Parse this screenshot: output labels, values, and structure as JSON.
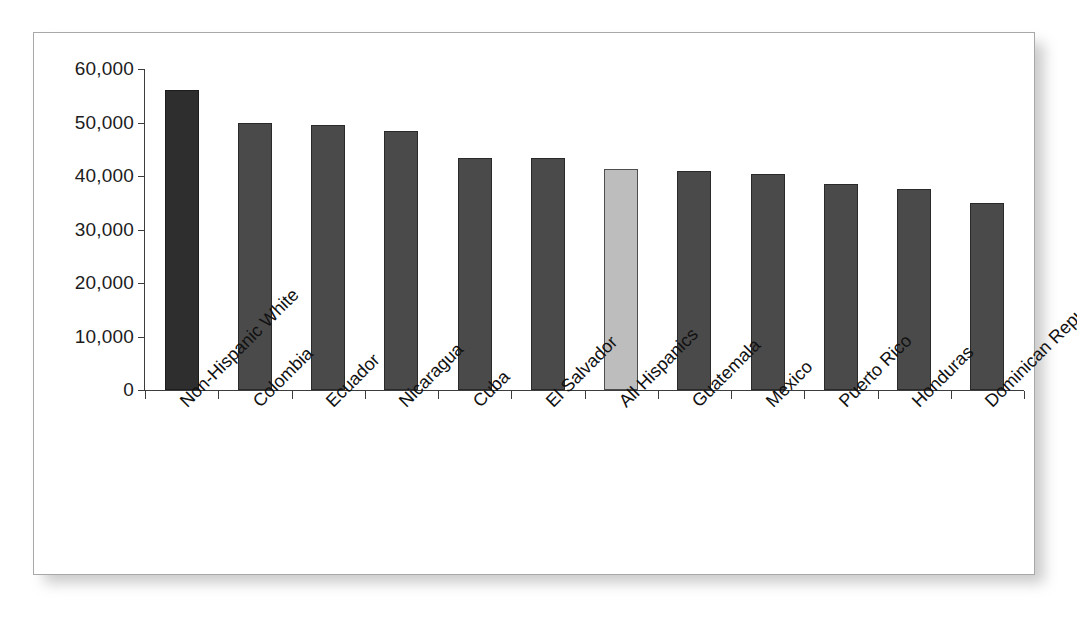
{
  "chart_data": {
    "type": "bar",
    "title": "",
    "subtitle": "",
    "xlabel": "",
    "ylabel": "",
    "ylim": [
      0,
      60000
    ],
    "grid": false,
    "legend": null,
    "orientation": "vertical",
    "categories": [
      "Non-Hispanic White",
      "Colombia",
      "Ecuador",
      "Nicaragua",
      "Cuba",
      "El Salvador",
      "All Hispanics",
      "Guatemala",
      "Mexico",
      "Puerto Rico",
      "Honduras",
      "Dominican Republic"
    ],
    "values": [
      56000,
      50000,
      49600,
      48500,
      43400,
      43300,
      41300,
      41000,
      40400,
      38500,
      37500,
      35000
    ],
    "ytick_labels": [
      "0",
      "10,000",
      "20,000",
      "30,000",
      "40,000",
      "50,000",
      "60,000"
    ],
    "ytick_values": [
      0,
      10000,
      20000,
      30000,
      40000,
      50000,
      60000
    ],
    "bar_styles": [
      "first",
      "normal",
      "normal",
      "normal",
      "normal",
      "normal",
      "highlight",
      "normal",
      "normal",
      "normal",
      "normal",
      "normal"
    ],
    "colors": {
      "bar_default": "#4a4a4a",
      "bar_first": "#2e2e2e",
      "bar_highlight": "#bdbdbd",
      "bar_outline": "#2a2a2a",
      "axis": "#3c3c3c",
      "text": "#111111",
      "frame_border": "#a8a8a8",
      "background": "#ffffff"
    }
  }
}
